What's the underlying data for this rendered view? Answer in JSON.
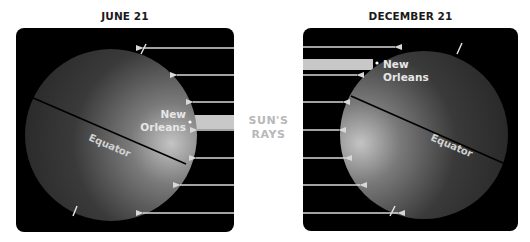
{
  "panels": [
    {
      "id": "june",
      "title": "JUNE 21",
      "frame": {
        "x": 16,
        "y": 28,
        "w": 218,
        "h": 204,
        "r": 8
      },
      "globe": {
        "cx": 111,
        "cy": 135,
        "r": 86,
        "lit_side": "right"
      },
      "equator": {
        "x1": 31,
        "y1": 97,
        "x2": 186,
        "y2": 164,
        "label": "Equator",
        "label_x": 88,
        "label_y": 140,
        "label_angle": 23
      },
      "axis_ticks": [
        {
          "x1": 146,
          "y1": 44,
          "x2": 141,
          "y2": 54
        },
        {
          "x1": 77,
          "y1": 206,
          "x2": 73,
          "y2": 216
        }
      ],
      "city": {
        "name_line1": "New",
        "name_line2": "Orleans",
        "dot_x": 190,
        "dot_y": 122,
        "text_x": 186,
        "text_y1": 118,
        "text_y2": 131,
        "anchor": "end"
      },
      "direct_band": {
        "x": 190,
        "y": 115,
        "w": 44,
        "h": 14
      },
      "rays": [
        {
          "y": 48,
          "from": 234,
          "to": 143
        },
        {
          "y": 75,
          "from": 234,
          "to": 177
        },
        {
          "y": 102,
          "from": 234,
          "to": 193
        },
        {
          "y": 130,
          "from": 234,
          "to": 197
        },
        {
          "y": 158,
          "from": 234,
          "to": 196
        },
        {
          "y": 185,
          "from": 234,
          "to": 180
        },
        {
          "y": 213,
          "from": 234,
          "to": 143
        }
      ]
    },
    {
      "id": "december",
      "title": "DECEMBER 21",
      "frame": {
        "x": 303,
        "y": 28,
        "w": 215,
        "h": 203,
        "r": 8
      },
      "globe": {
        "cx": 424,
        "cy": 135,
        "r": 84,
        "lit_side": "left"
      },
      "equator": {
        "x1": 351,
        "y1": 96,
        "x2": 503,
        "y2": 163,
        "label": "Equator",
        "label_x": 430,
        "label_y": 140,
        "label_angle": 23
      },
      "axis_ticks": [
        {
          "x1": 462,
          "y1": 43,
          "x2": 457,
          "y2": 54
        },
        {
          "x1": 395,
          "y1": 206,
          "x2": 390,
          "y2": 216
        }
      ],
      "city": {
        "name_line1": "New",
        "name_line2": "Orleans",
        "dot_x": 377,
        "dot_y": 63,
        "text_x": 383,
        "text_y1": 68,
        "text_y2": 81,
        "anchor": "start"
      },
      "direct_band": {
        "x": 303,
        "y": 59,
        "w": 70,
        "h": 11
      },
      "rays": [
        {
          "y": 47,
          "from": 303,
          "to": 395
        },
        {
          "y": 75,
          "from": 303,
          "to": 357
        },
        {
          "y": 102,
          "from": 303,
          "to": 343
        },
        {
          "y": 130,
          "from": 303,
          "to": 339
        },
        {
          "y": 158,
          "from": 303,
          "to": 345
        },
        {
          "y": 185,
          "from": 303,
          "to": 360
        },
        {
          "y": 213,
          "from": 303,
          "to": 398
        }
      ]
    }
  ],
  "center_label": {
    "line1": "SUN'S",
    "line2": "RAYS"
  },
  "colors": {
    "frame": "#000000",
    "globe_dark": "#2a2a2a",
    "globe_lit": "#b5b5b5",
    "ray": "#d8d8d8",
    "band": "#c8c8c8",
    "label_light": "#e6e6e6",
    "rays_label": "#b8b8b8",
    "title": "#1a1a1a"
  }
}
